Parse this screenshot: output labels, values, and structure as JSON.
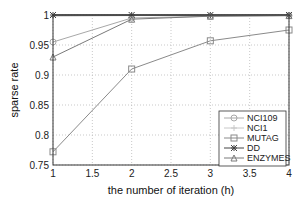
{
  "chart_data": {
    "type": "line",
    "title": "",
    "xlabel": "the number of iteration (h)",
    "ylabel": "sparse rate",
    "x": [
      1,
      2,
      3,
      4
    ],
    "xlim": [
      1,
      4
    ],
    "ylim": [
      0.75,
      1
    ],
    "xticks": [
      "1",
      "1.5",
      "2",
      "2.5",
      "3",
      "3.5",
      "4"
    ],
    "yticks": [
      "0.75",
      "0.8",
      "0.85",
      "0.9",
      "0.95",
      "1"
    ],
    "grid": true,
    "legend_position": "lower right",
    "series": [
      {
        "name": "NCI109",
        "marker": "circle",
        "color": "#a8a8a8",
        "values": [
          0.955,
          0.995,
          0.998,
          0.999
        ]
      },
      {
        "name": "NCI1",
        "marker": "plus",
        "color": "#c8c8c8",
        "values": [
          0.998,
          0.999,
          0.999,
          0.999
        ]
      },
      {
        "name": "MUTAG",
        "marker": "square",
        "color": "#8a8a8a",
        "values": [
          0.772,
          0.91,
          0.957,
          0.975
        ]
      },
      {
        "name": "DD",
        "marker": "star",
        "color": "#444444",
        "values": [
          1.0,
          1.0,
          1.0,
          1.0
        ]
      },
      {
        "name": "ENZYMES",
        "marker": "triangle",
        "color": "#7a7a7a",
        "values": [
          0.93,
          0.993,
          0.998,
          0.999
        ]
      }
    ]
  }
}
